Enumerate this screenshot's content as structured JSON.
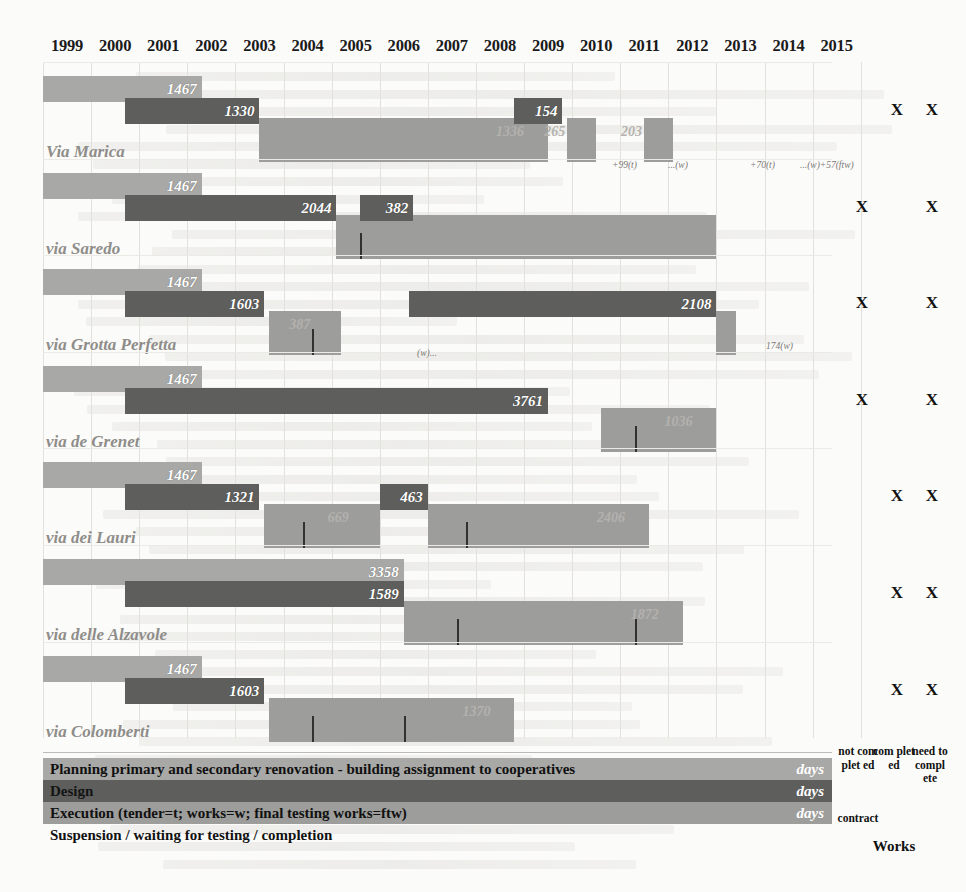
{
  "years": [
    "1999",
    "2000",
    "2001",
    "2002",
    "2003",
    "2004",
    "2005",
    "2006",
    "2007",
    "2008",
    "2009",
    "2010",
    "2011",
    "2012",
    "2013",
    "2014",
    "2015"
  ],
  "right_columns": {
    "not_completed": "not com plet ed",
    "completed": "com plet ed",
    "need_to_complete": "need to compl ete",
    "contract_label": "contract",
    "works_label": "Works"
  },
  "legend": {
    "rows": [
      {
        "label": "Planning primary and secondary renovation - building assignment to cooperatives",
        "unit": "days",
        "color": "#a8a8a6"
      },
      {
        "label": "Design",
        "unit": "days",
        "color": "#5e5e5c"
      },
      {
        "label": "Execution (tender=t; works=w; final testing works=ftw)",
        "unit": "days",
        "color": "#9d9d9b"
      },
      {
        "label": "Suspension / waiting for testing / completion",
        "unit": "",
        "color": "#ffffff"
      }
    ]
  },
  "colors": {
    "planning": "#a8a8a6",
    "design": "#5e5e5c",
    "execution": "#9d9d9b",
    "suspension": "#ffffff",
    "background": "#fbfbfa",
    "label_text": "#8f8d89"
  },
  "chart_data": {
    "type": "bar",
    "xlabel": "Year",
    "ylabel": "Project (street)",
    "xlim": [
      "1999",
      "2015"
    ],
    "grid": true,
    "legend_position": "bottom",
    "categories": [
      "Via Marica",
      "via Saredo",
      "via Grotta Perfetta",
      "via de Grenet",
      "via dei Lauri",
      "via delle Alzavole",
      "via Colomberti"
    ],
    "series": [
      {
        "name": "Planning primary and secondary renovation - building assignment to cooperatives",
        "unit": "days",
        "values": [
          1467,
          1467,
          1467,
          1467,
          1467,
          3358,
          1467
        ]
      },
      {
        "name": "Design",
        "unit": "days",
        "values": [
          1330,
          2044,
          1603,
          3761,
          1321,
          1589,
          1603
        ]
      },
      {
        "name": "Design (second segment)",
        "unit": "days",
        "values": [
          154,
          382,
          2108,
          null,
          463,
          null,
          null
        ]
      }
    ],
    "rows": [
      {
        "project": "Via Marica",
        "xmarks": [
          "completed",
          "need_to_complete"
        ],
        "planning": {
          "value": 1467,
          "start_year": 1999.0,
          "end_year": 2002.3
        },
        "design": [
          {
            "value": 1330,
            "start_year": 2000.7,
            "end_year": 2003.5
          },
          {
            "value": 154,
            "start_year": 2008.8,
            "end_year": 2009.8
          }
        ],
        "execution": [
          {
            "start_year": 2003.5,
            "end_year": 2009.5,
            "ghost": "1336"
          },
          {
            "start_year": 2009.9,
            "end_year": 2010.5,
            "ghost": "265"
          },
          {
            "start_year": 2011.5,
            "end_year": 2012.1,
            "ghost": "203"
          }
        ],
        "annotations": [
          "+99(t)",
          "...(w)",
          "+70(t)",
          "...(w)+57(ftw)"
        ]
      },
      {
        "project": "via Saredo",
        "xmarks": [
          "not_completed",
          "need_to_complete"
        ],
        "planning": {
          "value": 1467,
          "start_year": 1999.0,
          "end_year": 2002.3
        },
        "design": [
          {
            "value": 2044,
            "start_year": 2000.7,
            "end_year": 2005.1
          },
          {
            "value": 382,
            "start_year": 2005.6,
            "end_year": 2006.7
          }
        ],
        "execution": [
          {
            "start_year": 2005.1,
            "end_year": 2013.0,
            "ghost": ""
          }
        ],
        "ticks": [
          2005.6
        ],
        "annotations": []
      },
      {
        "project": "via Grotta Perfetta",
        "xmarks": [
          "not_completed",
          "need_to_complete"
        ],
        "planning": {
          "value": 1467,
          "start_year": 1999.0,
          "end_year": 2002.3
        },
        "design": [
          {
            "value": 1603,
            "start_year": 2000.7,
            "end_year": 2003.6
          },
          {
            "value": 2108,
            "start_year": 2006.6,
            "end_year": 2013.0
          }
        ],
        "execution": [
          {
            "start_year": 2003.7,
            "end_year": 2005.2,
            "ghost": "387"
          },
          {
            "start_year": 2013.0,
            "end_year": 2013.4,
            "ghost": ""
          }
        ],
        "ticks": [
          2004.6
        ],
        "annotations": [
          "(w)...",
          "174(w)"
        ]
      },
      {
        "project": "via de Grenet",
        "xmarks": [
          "not_completed",
          "need_to_complete"
        ],
        "planning": {
          "value": 1467,
          "start_year": 1999.0,
          "end_year": 2002.3
        },
        "design": [
          {
            "value": 3761,
            "start_year": 2000.7,
            "end_year": 2009.5
          }
        ],
        "execution": [
          {
            "start_year": 2010.6,
            "end_year": 2013.0,
            "ghost": "1036"
          }
        ],
        "ticks": [
          2011.3
        ],
        "annotations": []
      },
      {
        "project": "via dei Lauri",
        "xmarks": [
          "completed",
          "need_to_complete"
        ],
        "planning": {
          "value": 1467,
          "start_year": 1999.0,
          "end_year": 2002.3
        },
        "design": [
          {
            "value": 1321,
            "start_year": 2000.7,
            "end_year": 2003.5
          },
          {
            "value": 463,
            "start_year": 2006.0,
            "end_year": 2007.0
          }
        ],
        "execution": [
          {
            "start_year": 2003.6,
            "end_year": 2006.0,
            "ghost": "669"
          },
          {
            "start_year": 2007.0,
            "end_year": 2011.6,
            "ghost": "2406"
          }
        ],
        "ticks": [
          2004.4,
          2007.8
        ],
        "annotations": []
      },
      {
        "project": "via delle Alzavole",
        "xmarks": [
          "completed",
          "need_to_complete"
        ],
        "planning": {
          "value": 3358,
          "start_year": 1999.0,
          "end_year": 2006.5
        },
        "design": [
          {
            "value": 1589,
            "start_year": 2000.7,
            "end_year": 2006.5
          }
        ],
        "execution": [
          {
            "start_year": 2006.5,
            "end_year": 2012.3,
            "ghost": "1872"
          }
        ],
        "ticks": [
          2007.6,
          2011.3
        ],
        "annotations": []
      },
      {
        "project": "via Colomberti",
        "xmarks": [
          "completed",
          "need_to_complete"
        ],
        "planning": {
          "value": 1467,
          "start_year": 1999.0,
          "end_year": 2002.3
        },
        "design": [
          {
            "value": 1603,
            "start_year": 2000.7,
            "end_year": 2003.6
          }
        ],
        "execution": [
          {
            "start_year": 2003.7,
            "end_year": 2008.8,
            "ghost": "1370"
          }
        ],
        "ticks": [
          2004.6,
          2006.5
        ],
        "annotations": []
      }
    ]
  }
}
